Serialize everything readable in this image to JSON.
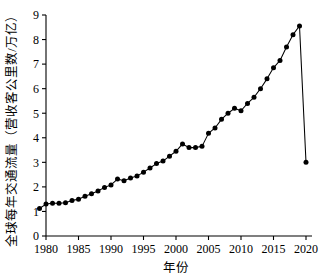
{
  "chart_data": {
    "type": "line",
    "title": "",
    "xlabel": "年份",
    "ylabel": "全球每年交通流量（营收客公里数/万亿）",
    "xlim": [
      1979,
      2020
    ],
    "ylim": [
      0,
      9
    ],
    "xticks": [
      1980,
      1985,
      1990,
      1995,
      2000,
      2005,
      2010,
      2015,
      2020
    ],
    "xtick_labels": [
      "1980",
      "1985",
      "1990",
      "1995",
      "2000",
      "2005",
      "2010",
      "2015",
      "2020"
    ],
    "yticks": [
      0,
      1,
      2,
      3,
      4,
      5,
      6,
      7,
      8,
      9
    ],
    "ytick_labels": [
      "0",
      "1",
      "2",
      "3",
      "4",
      "5",
      "6",
      "7",
      "8",
      "9"
    ],
    "grid": false,
    "legend": null,
    "marker": "filled-circle",
    "line_color": "#000000",
    "marker_color": "#000000",
    "x": [
      1979,
      1980,
      1981,
      1982,
      1983,
      1984,
      1985,
      1986,
      1987,
      1988,
      1989,
      1990,
      1991,
      1992,
      1993,
      1994,
      1995,
      1996,
      1997,
      1998,
      1999,
      2000,
      2001,
      2002,
      2003,
      2004,
      2005,
      2006,
      2007,
      2008,
      2009,
      2010,
      2011,
      2012,
      2013,
      2014,
      2015,
      2016,
      2017,
      2018,
      2019,
      2020
    ],
    "values": [
      1.12,
      1.3,
      1.33,
      1.33,
      1.35,
      1.45,
      1.5,
      1.62,
      1.72,
      1.83,
      1.98,
      2.08,
      2.32,
      2.25,
      2.36,
      2.44,
      2.6,
      2.77,
      2.95,
      3.05,
      3.25,
      3.45,
      3.75,
      3.6,
      3.6,
      3.65,
      4.18,
      4.4,
      4.75,
      5.0,
      5.2,
      5.1,
      5.4,
      5.65,
      6.0,
      6.4,
      6.85,
      7.15,
      7.7,
      8.2,
      8.55,
      3.0
    ]
  },
  "axes": {
    "y_axis_title": "全球每年交通流量（营收客公里数/万亿）",
    "x_axis_title": "年份"
  }
}
